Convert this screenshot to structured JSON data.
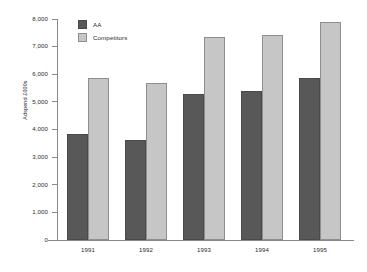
{
  "chart_data": {
    "type": "bar",
    "title": "",
    "xlabel": "",
    "ylabel": "Adspend £000s",
    "categories": [
      "1991",
      "1992",
      "1993",
      "1994",
      "1995"
    ],
    "series": [
      {
        "name": "AA",
        "color": "#585858",
        "values": [
          3850,
          3620,
          5300,
          5400,
          5870
        ]
      },
      {
        "name": "Competitors",
        "color": "#c6c6c6",
        "values": [
          5870,
          5670,
          7350,
          7420,
          7880
        ]
      }
    ],
    "ylim": [
      0,
      8000
    ],
    "ytick_step": 1000,
    "ytick_labels": [
      "0",
      "1,000",
      "2,000",
      "3,000",
      "4,000",
      "5,000",
      "6,000",
      "7,000",
      "8,000"
    ],
    "grid": false,
    "legend_position": "top-left"
  },
  "legend": {
    "entries": [
      {
        "label": "AA"
      },
      {
        "label": "Competitors"
      }
    ]
  },
  "axes": {
    "y_title": "Adspend £000s"
  }
}
